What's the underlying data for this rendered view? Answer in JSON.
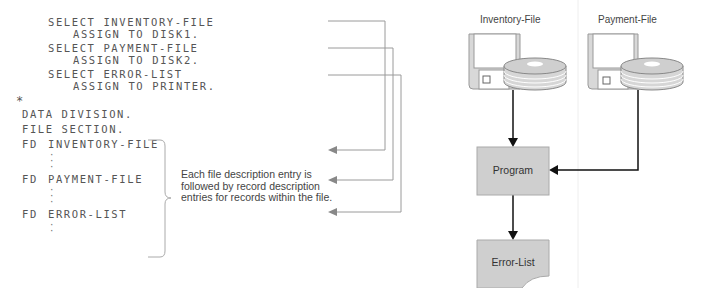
{
  "code_listing": {
    "environment_lines": [
      {
        "text": "SELECT INVENTORY-FILE",
        "indent": 0
      },
      {
        "text": "ASSIGN TO DISK1.",
        "indent": 1
      },
      {
        "text": "SELECT PAYMENT-FILE",
        "indent": 0
      },
      {
        "text": "ASSIGN TO DISK2.",
        "indent": 1
      },
      {
        "text": "SELECT ERROR-LIST",
        "indent": 0
      },
      {
        "text": "ASSIGN TO PRINTER.",
        "indent": 1
      }
    ],
    "comment_marker": "*",
    "data_division": "DATA DIVISION.",
    "file_section": "FILE SECTION.",
    "fd_entries": [
      {
        "keyword": "FD",
        "name": "INVENTORY-FILE"
      },
      {
        "keyword": "FD",
        "name": "PAYMENT-FILE"
      },
      {
        "keyword": "FD",
        "name": "ERROR-LIST"
      }
    ]
  },
  "annotation": {
    "text": "Each file description entry is\nfollowed by record description\nentries for records within the file."
  },
  "diagram": {
    "inputs": [
      {
        "label": "Inventory-File",
        "icon": "floppy-disk-and-disk-pack-icon"
      },
      {
        "label": "Payment-File",
        "icon": "floppy-disk-and-disk-pack-icon"
      }
    ],
    "process": {
      "label": "Program"
    },
    "output": {
      "label": "Error-List",
      "icon": "document-icon"
    }
  },
  "colors": {
    "code_text": "#555555",
    "connector": "#999999",
    "box_fill": "#cfcfcf",
    "box_stroke": "#aaaaaa",
    "flow_line": "#111111",
    "disk_fill": "#d4d4d4"
  }
}
